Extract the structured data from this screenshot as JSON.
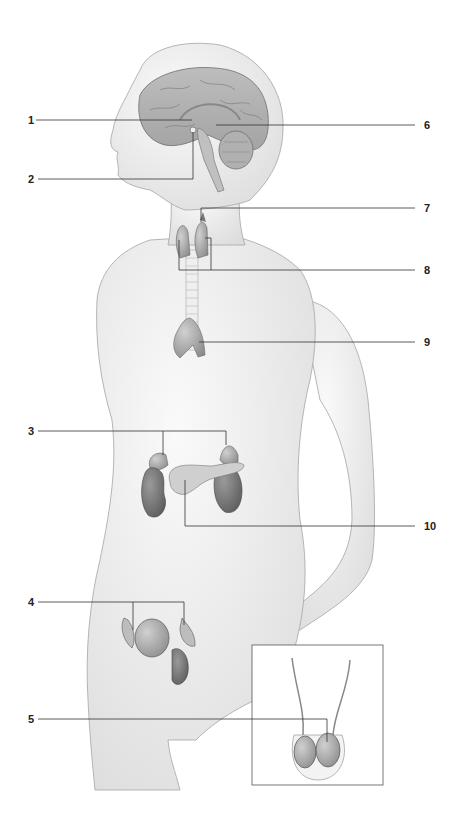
{
  "diagram": {
    "labels": [
      {
        "id": "1",
        "text": "1",
        "side": "left",
        "y": 120,
        "target": "hypothalamus"
      },
      {
        "id": "2",
        "text": "2",
        "side": "left",
        "y": 179,
        "target": "pituitary gland"
      },
      {
        "id": "3",
        "text": "3",
        "side": "left",
        "y": 431,
        "target": "adrenal glands"
      },
      {
        "id": "4",
        "text": "4",
        "side": "left",
        "y": 602,
        "target": "ovaries"
      },
      {
        "id": "5",
        "text": "5",
        "side": "left",
        "y": 719,
        "target": "testes"
      },
      {
        "id": "6",
        "text": "6",
        "side": "right",
        "y": 125,
        "target": "pineal gland"
      },
      {
        "id": "7",
        "text": "7",
        "side": "right",
        "y": 208,
        "target": "parathyroid glands"
      },
      {
        "id": "8",
        "text": "8",
        "side": "right",
        "y": 270,
        "target": "thyroid gland"
      },
      {
        "id": "9",
        "text": "9",
        "side": "right",
        "y": 342,
        "target": "thymus"
      },
      {
        "id": "10",
        "text": "10",
        "side": "right",
        "y": 526,
        "target": "pancreas"
      }
    ],
    "colors": {
      "skin": "#ececec",
      "skin_edge": "#9a9a9a",
      "organ": "#b8b8b8",
      "organ_dark": "#6e6e6e",
      "leader": "#333333",
      "label": "#222222"
    }
  }
}
